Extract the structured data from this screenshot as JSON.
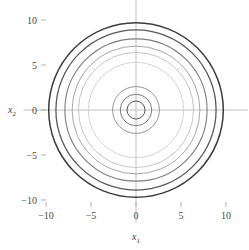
{
  "figure": {
    "background": "#ffffff",
    "width": 248,
    "height": 250
  },
  "axes": {
    "x_title": "x",
    "x_subscript": "1",
    "y_title": "x",
    "y_subscript": "2",
    "axis_color": "#b9b9b9",
    "tick_color": "#9d9d9d",
    "label_color": "#4a4a4a"
  },
  "chart_data": {
    "type": "line",
    "title": "",
    "xlabel": "x1",
    "ylabel": "x2",
    "xlim": [
      -12.5,
      12.5
    ],
    "ylim": [
      -12.5,
      12.5
    ],
    "xticks": [
      -10,
      -5,
      0,
      5,
      10
    ],
    "xticklabels": [
      "−10",
      "−5",
      "0",
      "5",
      "10"
    ],
    "yticks": [
      -10,
      -5,
      0,
      5,
      10
    ],
    "yticklabels": [
      "−10",
      "−5",
      "0",
      "5",
      "10"
    ],
    "grid": false,
    "legend": null,
    "center": [
      0,
      0
    ],
    "series": [
      {
        "name": "ring-1",
        "radius": 1.0,
        "color": "#555555",
        "width": 1.0
      },
      {
        "name": "ring-2",
        "radius": 1.75,
        "color": "#6e6e6e",
        "width": 0.9
      },
      {
        "name": "ring-3",
        "radius": 2.6,
        "color": "#8a8a8a",
        "width": 0.9
      },
      {
        "name": "ring-4",
        "radius": 5.3,
        "color": "#cdcdcd",
        "width": 0.9
      },
      {
        "name": "ring-5",
        "radius": 6.4,
        "color": "#bdbdbd",
        "width": 0.9
      },
      {
        "name": "ring-6",
        "radius": 7.1,
        "color": "#a6a6a6",
        "width": 1.0
      },
      {
        "name": "ring-7",
        "radius": 7.9,
        "color": "#7d7d7d",
        "width": 1.1
      },
      {
        "name": "ring-8",
        "radius": 8.9,
        "color": "#585858",
        "width": 1.3
      },
      {
        "name": "ring-9",
        "radius": 9.7,
        "color": "#3c3c3c",
        "width": 1.5
      }
    ]
  }
}
